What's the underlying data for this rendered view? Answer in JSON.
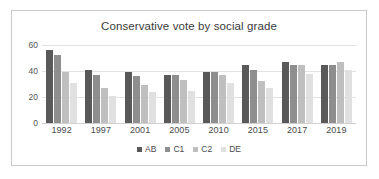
{
  "chart_data": {
    "type": "bar",
    "title": "Conservative vote by social grade",
    "xlabel": "",
    "ylabel": "",
    "ylim": [
      0,
      60
    ],
    "yticks": [
      0,
      20,
      40,
      60
    ],
    "grid": true,
    "legend_position": "bottom",
    "categories": [
      "1992",
      "1997",
      "2001",
      "2005",
      "2010",
      "2015",
      "2017",
      "2019"
    ],
    "series": [
      {
        "name": "AB",
        "color": "#595959",
        "values": [
          56,
          41,
          39,
          37,
          39,
          45,
          47,
          45
        ]
      },
      {
        "name": "C1",
        "color": "#8e8e8e",
        "values": [
          52,
          37,
          36,
          37,
          39,
          41,
          45,
          45
        ]
      },
      {
        "name": "C2",
        "color": "#bfbfbf",
        "values": [
          39,
          27,
          29,
          33,
          37,
          32,
          45,
          47
        ]
      },
      {
        "name": "DE",
        "color": "#e0e0e0",
        "values": [
          31,
          21,
          24,
          25,
          31,
          27,
          38,
          41
        ]
      }
    ]
  },
  "style": {
    "border_color": "#c9c9c9",
    "gridline_color": "#e2e2e2",
    "text_color": "#4a4a4a",
    "background": "#ffffff"
  }
}
